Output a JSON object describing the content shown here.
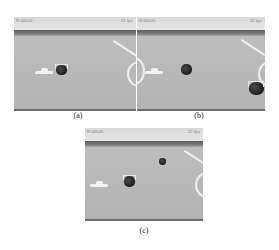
{
  "figure": {
    "panels": [
      {
        "id": "a",
        "caption": "(a)",
        "timestamp_left": "R:00h20",
        "timestamp_right": "21 fps",
        "objects": [
          {
            "type": "ball",
            "tracked": true
          }
        ]
      },
      {
        "id": "b",
        "caption": "(b)",
        "timestamp_left": "R:00h20",
        "timestamp_right": "21 fps",
        "objects": [
          {
            "type": "ball",
            "tracked": false
          },
          {
            "type": "ball",
            "tracked": true
          }
        ]
      },
      {
        "id": "c",
        "caption": "(c)",
        "timestamp_left": "R:00h20",
        "timestamp_right": "22 fps",
        "objects": [
          {
            "type": "ball",
            "tracked": true
          },
          {
            "type": "ball",
            "tracked": false
          }
        ]
      }
    ],
    "colors": {
      "floor": "#b9b9b9",
      "wall": "#5e5e5e",
      "field_line": "#efefef",
      "ball": "#1e1e1e"
    }
  }
}
